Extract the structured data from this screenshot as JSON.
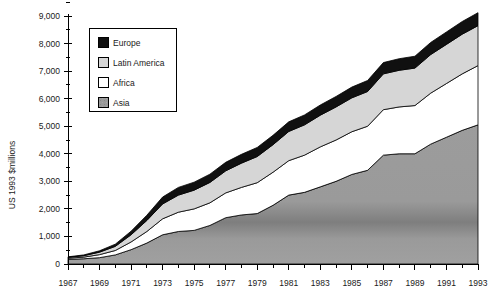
{
  "chart_data": {
    "type": "area",
    "stacked": true,
    "title": "",
    "xlabel": "",
    "ylabel": "US 1993 $millions",
    "xlim": [
      1967,
      1993
    ],
    "ylim": [
      0,
      9000
    ],
    "grid": false,
    "legend_position": "upper-left-inside",
    "y_ticks": [
      0,
      1000,
      2000,
      3000,
      4000,
      5000,
      6000,
      7000,
      8000,
      9000
    ],
    "y_tick_labels": [
      "0",
      "1,000",
      "2,000",
      "3,000",
      "4,000",
      "5,000",
      "6,000",
      "7,000",
      "8,000",
      "9,000"
    ],
    "y_minor_tick_interval": 500,
    "x": [
      1967,
      1968,
      1969,
      1970,
      1971,
      1972,
      1973,
      1974,
      1975,
      1976,
      1977,
      1978,
      1979,
      1980,
      1981,
      1982,
      1983,
      1984,
      1985,
      1986,
      1987,
      1988,
      1989,
      1990,
      1991,
      1992,
      1993
    ],
    "x_tick_labels": [
      "1967",
      "1969",
      "1971",
      "1973",
      "1975",
      "1977",
      "1979",
      "1981",
      "1983",
      "1985",
      "1987",
      "1989",
      "1991",
      "1993"
    ],
    "x_tick_label_years": [
      1967,
      1969,
      1971,
      1973,
      1975,
      1977,
      1979,
      1981,
      1983,
      1985,
      1987,
      1989,
      1991,
      1993
    ],
    "series": [
      {
        "name": "Asia",
        "color": "#9a9a9a",
        "values": [
          170,
          190,
          230,
          330,
          520,
          760,
          1060,
          1180,
          1220,
          1400,
          1680,
          1780,
          1830,
          2130,
          2500,
          2600,
          2800,
          3000,
          3250,
          3400,
          3950,
          4000,
          4000,
          4350,
          4600,
          4850,
          5050
        ]
      },
      {
        "name": "Africa",
        "color": "#ffffff",
        "values": [
          40,
          60,
          110,
          160,
          280,
          420,
          580,
          700,
          780,
          820,
          900,
          1000,
          1120,
          1200,
          1250,
          1350,
          1450,
          1500,
          1550,
          1600,
          1650,
          1700,
          1750,
          1850,
          1950,
          2050,
          2150
        ]
      },
      {
        "name": "Latin America",
        "color": "#d6d6d6",
        "values": [
          30,
          50,
          90,
          150,
          260,
          400,
          540,
          620,
          680,
          740,
          800,
          880,
          950,
          1000,
          1060,
          1100,
          1150,
          1200,
          1230,
          1260,
          1300,
          1330,
          1360,
          1400,
          1420,
          1440,
          1450
        ]
      },
      {
        "name": "Europe",
        "color": "#101010",
        "values": [
          20,
          30,
          50,
          80,
          130,
          190,
          250,
          280,
          290,
          300,
          310,
          320,
          330,
          340,
          350,
          360,
          370,
          380,
          390,
          400,
          410,
          420,
          430,
          440,
          450,
          460,
          470
        ]
      }
    ],
    "totals": [
      260,
      330,
      480,
      720,
      1190,
      1770,
      2430,
      2780,
      2970,
      3260,
      3690,
      3980,
      4230,
      4670,
      5160,
      5410,
      5770,
      6080,
      6420,
      6660,
      7310,
      7450,
      7540,
      8040,
      8420,
      8800,
      9120
    ]
  },
  "legend": {
    "items": [
      {
        "label": "Europe",
        "color": "#101010"
      },
      {
        "label": "Latin America",
        "color": "#d6d6d6"
      },
      {
        "label": "Africa",
        "color": "#ffffff"
      },
      {
        "label": "Asia",
        "color": "#9a9a9a"
      }
    ]
  },
  "axes": {
    "y_title": "US 1993 $millions"
  }
}
